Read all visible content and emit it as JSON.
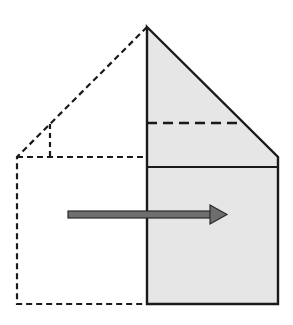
{
  "diagram": {
    "title": "",
    "colors": {
      "background": "#ffffff",
      "stroke": "#1a1a1a",
      "fill": "#e6e6e6",
      "arrow_fill": "#6e6e6e",
      "arrow_stroke": "#2a2a2a"
    },
    "solid_shape": {
      "points": [
        [
          147,
          27
        ],
        [
          278,
          157
        ],
        [
          278,
          304
        ],
        [
          147,
          304
        ]
      ]
    },
    "solid_divider": {
      "x1": 147,
      "y1": 167,
      "x2": 278,
      "y2": 167
    },
    "solid_dashed_line": {
      "x1": 147,
      "y1": 123,
      "x2": 243,
      "y2": 123
    },
    "dashed_shape": {
      "points": [
        [
          147,
          27
        ],
        [
          17,
          157
        ],
        [
          17,
          304
        ],
        [
          147,
          304
        ]
      ]
    },
    "dashed_divider": {
      "x1": 17,
      "y1": 157,
      "x2": 147,
      "y2": 157
    },
    "dashed_vertical": {
      "x1": 50,
      "y1": 124,
      "x2": 50,
      "y2": 157
    },
    "arrow": {
      "shaft": {
        "x": 68,
        "y": 211,
        "width": 143,
        "height": 7
      },
      "head": [
        [
          210,
          205
        ],
        [
          227,
          214.5
        ],
        [
          210,
          224
        ]
      ],
      "direction": "right"
    }
  }
}
